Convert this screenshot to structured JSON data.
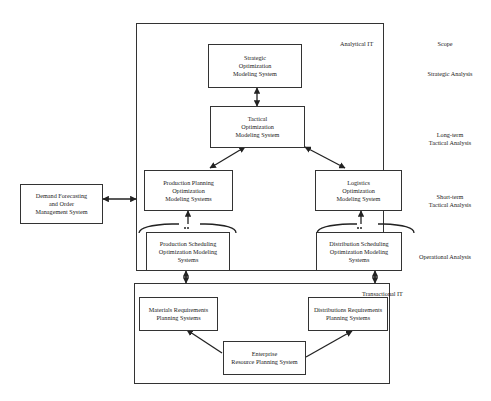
{
  "frames": {
    "analytical": {
      "label": "Analytical IT"
    },
    "transactional": {
      "label": "Transactional IT"
    }
  },
  "scope": {
    "header": "Scope",
    "levels": [
      {
        "label": "Strategic Analysis"
      },
      {
        "label": "Long-term\nTactical Analysis"
      },
      {
        "label": "Short-term\nTactical Analysis"
      },
      {
        "label": "Operational Analysis"
      }
    ]
  },
  "nodes": {
    "strategic": "Strategic\nOptimization\nModeling System",
    "tactical": "Tactical\nOptimization\nModeling System",
    "production_planning": "Production Planning\nOptimization\nModeling Systems",
    "logistics": "Logistics\nOptimization\nModeling System",
    "production_scheduling": "Production Scheduling\nOptimization Modeling\nSystems",
    "distribution_scheduling": "Distribution Scheduling\nOptimization Modeling\nSystems",
    "demand_forecasting": "Demand Forecasting\nand Order\nManagement System",
    "mrp": "Materials Requirements\nPlanning Systems",
    "drp": "Distributions Requirements\nPlanning Systems",
    "erp": "Enterprise\nResource Planning System"
  },
  "edges": [
    {
      "from": "strategic",
      "to": "tactical",
      "type": "bidirectional"
    },
    {
      "from": "tactical",
      "to": "production_planning",
      "type": "bidirectional"
    },
    {
      "from": "tactical",
      "to": "logistics",
      "type": "bidirectional"
    },
    {
      "from": "production_scheduling",
      "to": "production_planning",
      "type": "bidirectional"
    },
    {
      "from": "distribution_scheduling",
      "to": "logistics",
      "type": "bidirectional"
    },
    {
      "from": "demand_forecasting",
      "to": "analytical_it",
      "type": "bidirectional"
    },
    {
      "from": "production_scheduling",
      "to": "transactional_it",
      "type": "bidirectional"
    },
    {
      "from": "distribution_scheduling",
      "to": "transactional_it",
      "type": "bidirectional"
    },
    {
      "from": "erp",
      "to": "mrp",
      "type": "directed"
    },
    {
      "from": "erp",
      "to": "drp",
      "type": "directed"
    }
  ]
}
